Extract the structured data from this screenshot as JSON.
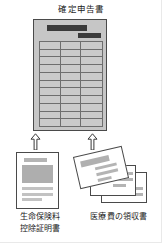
{
  "diagram": {
    "title": "確定申告書",
    "tax_form": {
      "name": "確定申告書",
      "header_bars": 2,
      "table": {
        "rows": 11,
        "columns": 3,
        "column_widths": [
          "34%",
          "33%",
          "33%"
        ]
      }
    },
    "arrows": [
      {
        "id": "arrow-left",
        "direction": "up",
        "from": "生命保険料控除証明書",
        "to": "確定申告書"
      },
      {
        "id": "arrow-right",
        "direction": "up",
        "from": "医療費の領収書",
        "to": "確定申告書"
      }
    ],
    "sources": [
      {
        "id": "insurance-certificate",
        "caption_lines": [
          "生命保険料",
          "控除証明書"
        ],
        "caption_full": "生命保険料控除証明書",
        "doc_type": "single-sheet",
        "sheets": 1
      },
      {
        "id": "medical-receipts",
        "caption_lines": [
          "医療費の領収書"
        ],
        "caption_full": "医療費の領収書",
        "doc_type": "stacked-receipts",
        "sheets": 3
      }
    ],
    "colors": {
      "page_background": "#ffffff",
      "form_fill": "#c6c6c6",
      "form_outline": "#4a4a4a",
      "bar_dark": "#3a3a3a",
      "bar_light": "#b4b4b4",
      "grid_line": "#6e6e6e",
      "text": "#1a1a1a"
    }
  }
}
